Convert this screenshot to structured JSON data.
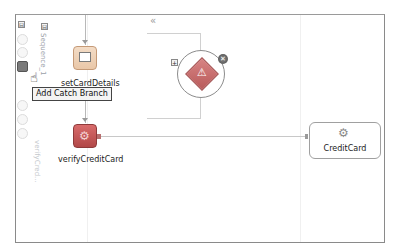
{
  "canvas": {
    "frame_color": "#8a8a8a",
    "collapse_toggle": "⊟",
    "expand_toggle": "«"
  },
  "sidebar": {
    "collapse_icon": "⊟",
    "items": [
      {
        "name": "scope-icon"
      },
      {
        "name": "scope-icon-2"
      },
      {
        "name": "add-catch-branch-icon"
      },
      {
        "name": "catch-all-icon"
      },
      {
        "name": "compensation-icon"
      },
      {
        "name": "event-handler-icon"
      },
      {
        "name": "termination-icon"
      }
    ]
  },
  "sequence": {
    "label": "Sequence_1",
    "lower_label": "verifyCred..."
  },
  "activities": [
    {
      "label": "setCardDetails",
      "type": "assign",
      "color": "#e9c7a8"
    },
    {
      "label": "verifyCreditCard",
      "type": "invoke",
      "color": "#b24848"
    }
  ],
  "tooltip": {
    "text": "Add Catch Branch"
  },
  "catch_branch": {
    "expand_label": "+",
    "close_label": "✕",
    "warning_glyph": "⚠"
  },
  "partner_link": {
    "label": "CreditCard",
    "icon": "⚙"
  }
}
